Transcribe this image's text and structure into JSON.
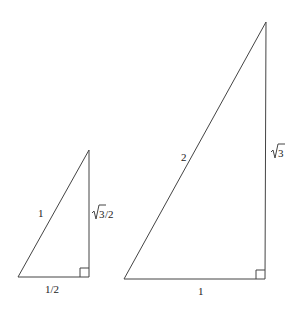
{
  "diagram": {
    "small_triangle": {
      "hypotenuse_label": "1",
      "vertical_label_root": "3",
      "vertical_label_suffix": "/2",
      "base_label": "1/2",
      "right_angle": true
    },
    "large_triangle": {
      "hypotenuse_label": "2",
      "vertical_label_root": "3",
      "base_label": "1",
      "right_angle": true
    }
  }
}
